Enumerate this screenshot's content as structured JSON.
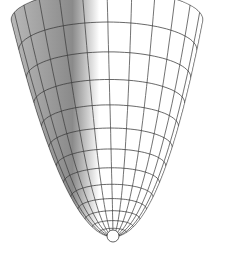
{
  "figure": {
    "width": 226,
    "height": 258,
    "background": "#ffffff",
    "surface": {
      "vertex": [
        113,
        237
      ],
      "hole_radius": 6,
      "top_y": 20,
      "rim_half_width": 96,
      "rim_tilt_ry": 30,
      "axis_lean_x": -6,
      "rings": 14,
      "meridians": 24,
      "shade_dark": "#8a8a8a",
      "shade_light": "#ffffff",
      "grid_color": "#3a3a3a",
      "grid_width": 0.9
    }
  }
}
